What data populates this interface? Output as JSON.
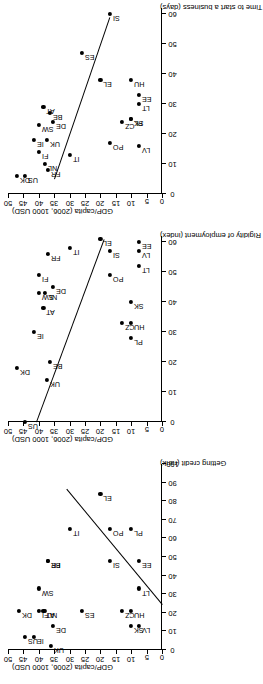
{
  "figure": {
    "shared_ylabel": "GDP/capita (2006, 1000 USD)",
    "y_ticks": [
      "0",
      "5",
      "10",
      "15",
      "20",
      "25",
      "30",
      "35",
      "40",
      "45",
      "50"
    ],
    "marker": "filled-diamond",
    "trendline_color": "#000000",
    "rotation_degrees": -90
  },
  "chart_data": [
    {
      "type": "scatter",
      "title": "",
      "xlabel": "Getting credit (rank)",
      "ylabel": "GDP/capita (2006, 1000 USD)",
      "xlim": [
        0,
        100
      ],
      "ylim": [
        0,
        50
      ],
      "xticks": [
        0,
        10,
        20,
        30,
        40,
        50,
        60,
        70,
        80,
        90,
        100
      ],
      "yticks": [
        0,
        5,
        10,
        15,
        20,
        25,
        30,
        35,
        40,
        45,
        50
      ],
      "grid": false,
      "legend": "none",
      "point_label_field": "country",
      "points": [
        {
          "country": "US",
          "x": 7,
          "y": 44.5
        },
        {
          "country": "DK",
          "x": 21,
          "y": 46.5
        },
        {
          "country": "IE",
          "x": 7,
          "y": 41.5
        },
        {
          "country": "FI",
          "x": 21,
          "y": 40.0
        },
        {
          "country": "SW",
          "x": 33,
          "y": 40.0
        },
        {
          "country": "UK",
          "x": 2,
          "y": 36.0
        },
        {
          "country": "NL",
          "x": 21,
          "y": 38.0
        },
        {
          "country": "AT",
          "x": 21,
          "y": 38.5
        },
        {
          "country": "DE",
          "x": 13,
          "y": 35.5
        },
        {
          "country": "BE",
          "x": 48,
          "y": 37.0
        },
        {
          "country": "FR",
          "x": 48,
          "y": 37.0
        },
        {
          "country": "IT",
          "x": 65,
          "y": 30.0
        },
        {
          "country": "EL",
          "x": 84,
          "y": 20.0
        },
        {
          "country": "ES",
          "x": 21,
          "y": 26.0
        },
        {
          "country": "PO",
          "x": 65,
          "y": 17.0
        },
        {
          "country": "SI",
          "x": 48,
          "y": 17.0
        },
        {
          "country": "PL",
          "x": 65,
          "y": 10.0
        },
        {
          "country": "CZ",
          "x": 21,
          "y": 13.0
        },
        {
          "country": "HU",
          "x": 21,
          "y": 10.0
        },
        {
          "country": "SK",
          "x": 13,
          "y": 10.0
        },
        {
          "country": "EE",
          "x": 48,
          "y": 7.5
        },
        {
          "country": "LT",
          "x": 33,
          "y": 7.5
        },
        {
          "country": "LV",
          "x": 13,
          "y": 7.5
        }
      ],
      "trendline": {
        "x1": 24,
        "y1": 0,
        "x2": 86,
        "y2": 31
      }
    },
    {
      "type": "scatter",
      "title": "",
      "xlabel": "Rigidity of employment (index)",
      "ylabel": "GDP/capita (2006, 1000 USD)",
      "xlim": [
        0,
        62
      ],
      "ylim": [
        0,
        50
      ],
      "xticks": [
        0,
        10,
        20,
        30,
        40,
        50,
        60
      ],
      "yticks": [
        0,
        5,
        10,
        15,
        20,
        25,
        30,
        35,
        40,
        45,
        50
      ],
      "grid": false,
      "legend": "none",
      "point_label_field": "country",
      "points": [
        {
          "country": "US",
          "x": 0,
          "y": 44.5
        },
        {
          "country": "DK",
          "x": 18,
          "y": 47.0
        },
        {
          "country": "UK",
          "x": 14,
          "y": 37.5
        },
        {
          "country": "BE",
          "x": 20,
          "y": 36.5
        },
        {
          "country": "IE",
          "x": 30,
          "y": 41.5
        },
        {
          "country": "AT",
          "x": 38,
          "y": 38.5
        },
        {
          "country": "SW",
          "x": 43,
          "y": 40.0
        },
        {
          "country": "NL",
          "x": 43,
          "y": 38.0
        },
        {
          "country": "DE",
          "x": 45,
          "y": 35.5
        },
        {
          "country": "FI",
          "x": 49,
          "y": 40.0
        },
        {
          "country": "FR",
          "x": 56,
          "y": 37.0
        },
        {
          "country": "IT",
          "x": 58,
          "y": 30.0
        },
        {
          "country": "EL",
          "x": 61,
          "y": 20.0
        },
        {
          "country": "PO",
          "x": 49,
          "y": 17.0
        },
        {
          "country": "SI",
          "x": 57,
          "y": 17.0
        },
        {
          "country": "PL",
          "x": 28,
          "y": 10.0
        },
        {
          "country": "CZ",
          "x": 33,
          "y": 13.0
        },
        {
          "country": "HU",
          "x": 33,
          "y": 10.0
        },
        {
          "country": "SK",
          "x": 40,
          "y": 10.0
        },
        {
          "country": "LV",
          "x": 57,
          "y": 7.5
        },
        {
          "country": "LT",
          "x": 52,
          "y": 7.5
        },
        {
          "country": "EE",
          "x": 60,
          "y": 7.5
        }
      ],
      "trendline": {
        "x1": 0,
        "y1": 41,
        "x2": 61,
        "y2": 19
      }
    },
    {
      "type": "scatter",
      "title": "",
      "xlabel": "Time to start a business (days)",
      "ylabel": "GDP/capita (2006, 1000 USD)",
      "xlim": [
        0,
        62
      ],
      "ylim": [
        0,
        50
      ],
      "xticks": [
        0,
        10,
        20,
        30,
        40,
        50,
        60
      ],
      "yticks": [
        0,
        5,
        10,
        15,
        20,
        25,
        30,
        35,
        40,
        45,
        50
      ],
      "grid": false,
      "legend": "none",
      "point_label_field": "country",
      "points": [
        {
          "country": "DK",
          "x": 6,
          "y": 47.0
        },
        {
          "country": "US",
          "x": 6,
          "y": 44.5
        },
        {
          "country": "FR",
          "x": 8,
          "y": 37.0
        },
        {
          "country": "NL",
          "x": 10,
          "y": 38.0
        },
        {
          "country": "IE",
          "x": 18,
          "y": 41.5
        },
        {
          "country": "FI",
          "x": 14,
          "y": 40.0
        },
        {
          "country": "UK",
          "x": 18,
          "y": 37.5
        },
        {
          "country": "SW",
          "x": 23,
          "y": 40.0
        },
        {
          "country": "DE",
          "x": 24,
          "y": 35.5
        },
        {
          "country": "BE",
          "x": 27,
          "y": 36.5
        },
        {
          "country": "AT",
          "x": 29,
          "y": 38.5
        },
        {
          "country": "IT",
          "x": 13,
          "y": 30.0
        },
        {
          "country": "PO",
          "x": 17,
          "y": 17.0
        },
        {
          "country": "EL",
          "x": 38,
          "y": 20.0
        },
        {
          "country": "ES",
          "x": 47,
          "y": 26.0
        },
        {
          "country": "SI",
          "x": 60,
          "y": 17.0
        },
        {
          "country": "CZ",
          "x": 24,
          "y": 13.0
        },
        {
          "country": "PL",
          "x": 25,
          "y": 10.0
        },
        {
          "country": "SK",
          "x": 25,
          "y": 10.0
        },
        {
          "country": "LT",
          "x": 30,
          "y": 7.5
        },
        {
          "country": "EE",
          "x": 33,
          "y": 7.5
        },
        {
          "country": "HU",
          "x": 38,
          "y": 10.0
        },
        {
          "country": "LV",
          "x": 16,
          "y": 7.5
        }
      ],
      "trendline": {
        "x1": 5,
        "y1": 35,
        "x2": 59,
        "y2": 17
      }
    }
  ]
}
